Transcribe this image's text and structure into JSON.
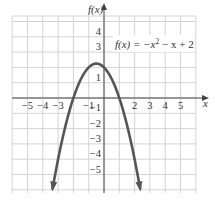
{
  "chart_data": {
    "type": "line",
    "title": "",
    "function": "f(x) = -x^2 - x + 2",
    "equation_label": {
      "prefix": "f(x) = −x",
      "exp": "2",
      "suffix": " − x + 2"
    },
    "xlabel": "x",
    "ylabel": "f(x)",
    "xlim": [
      -6,
      6
    ],
    "ylim": [
      -6,
      5.4
    ],
    "grid": true,
    "x_ticks": [
      {
        "v": -5,
        "label": "−5"
      },
      {
        "v": -4,
        "label": "−4"
      },
      {
        "v": -3,
        "label": "−3"
      },
      {
        "v": -1,
        "label": "−1"
      },
      {
        "v": 2,
        "label": "2"
      },
      {
        "v": 3,
        "label": "3"
      },
      {
        "v": 4,
        "label": "4"
      },
      {
        "v": 5,
        "label": "5"
      }
    ],
    "y_ticks": [
      {
        "v": 4,
        "label": "4"
      },
      {
        "v": 3,
        "label": "3"
      },
      {
        "v": 1,
        "label": "1"
      },
      {
        "v": -1,
        "label": "−1"
      },
      {
        "v": -2,
        "label": "−2"
      },
      {
        "v": -3,
        "label": "−3"
      },
      {
        "v": -4,
        "label": "−4"
      },
      {
        "v": -5,
        "label": "−5"
      }
    ],
    "series": [
      {
        "name": "f(x) = -x^2 - x + 2",
        "x_range": [
          -3.37,
          2.37
        ],
        "vertex": [
          -0.5,
          2.25
        ],
        "x_intercepts": [
          -2,
          1
        ],
        "y_intercept": 2,
        "color": "#555555"
      }
    ],
    "arrows_at_ends": true
  }
}
